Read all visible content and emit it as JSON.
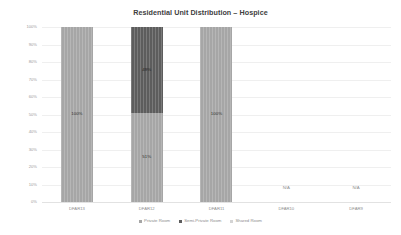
{
  "chart_data": {
    "type": "bar",
    "title": "Residential Unit Distribution – Hospice",
    "xlabel": "",
    "ylabel": "",
    "ylim": [
      0,
      100
    ],
    "stacked": true,
    "grid": true,
    "legend_position": "bottom",
    "categories": [
      "DFAR13",
      "DFAR12",
      "DFAR11",
      "DFAR10",
      "DFAR9"
    ],
    "ytick_labels": [
      "100%",
      "90%",
      "80%",
      "70%",
      "60%",
      "50%",
      "40%",
      "30%",
      "20%",
      "10%",
      "0%"
    ],
    "ytick_values": [
      100,
      90,
      80,
      70,
      60,
      50,
      40,
      30,
      20,
      10,
      0
    ],
    "series": [
      {
        "name": "Private Room",
        "color": "#a6a6a6",
        "values": [
          100,
          51,
          100,
          null,
          null
        ],
        "labels": [
          "100%",
          "51%",
          "100%",
          "",
          ""
        ]
      },
      {
        "name": "Semi-Private Room",
        "color": "#5d5d5d",
        "values": [
          0,
          49,
          0,
          null,
          null
        ],
        "labels": [
          "",
          "49%",
          "",
          "",
          ""
        ]
      },
      {
        "name": "Shared Room",
        "color": "#d4d4d4",
        "values": [
          0,
          0,
          0,
          null,
          null
        ],
        "labels": [
          "",
          "",
          "",
          "",
          ""
        ]
      }
    ],
    "no_data_label": "N/A",
    "no_data_categories": [
      "DFAR10",
      "DFAR9"
    ]
  },
  "legend": {
    "items": [
      {
        "label": "Private Room"
      },
      {
        "label": "Semi-Private Room"
      },
      {
        "label": "Shared Room"
      }
    ]
  }
}
